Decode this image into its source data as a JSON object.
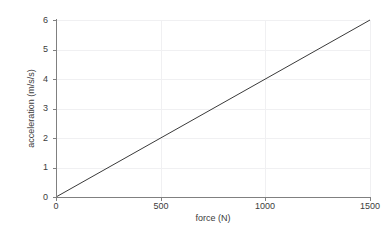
{
  "chart_data": {
    "type": "line",
    "title": "",
    "xlabel": "force (N)",
    "ylabel": "acceleration (m/s/s)",
    "xlim": [
      0,
      1500
    ],
    "ylim": [
      0,
      6
    ],
    "xticks": [
      0,
      500,
      1000,
      1500
    ],
    "xtick_labels": [
      "0",
      "500",
      "1000",
      "1500"
    ],
    "yticks": [
      0,
      1,
      2,
      3,
      4,
      5,
      6
    ],
    "ytick_labels": [
      "0",
      "1",
      "2",
      "3",
      "4",
      "5",
      "6"
    ],
    "grid": true,
    "legend": "none",
    "series": [
      {
        "name": "acceleration vs force",
        "x": [
          0,
          1500
        ],
        "y": [
          0,
          6
        ],
        "slope": 0.004,
        "intercept": 0,
        "color": "#3a3a3a",
        "linewidth": 1
      }
    ]
  },
  "style": {
    "background": "#ffffff",
    "grid_color": "#f0f0f2",
    "spine_color": "#808080",
    "text_color": "#3c3c3c",
    "line_color": "#3a3a3a"
  }
}
